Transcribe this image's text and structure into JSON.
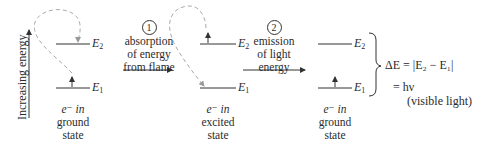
{
  "axis": {
    "label": "Increasing energy"
  },
  "levels": {
    "upper": "E",
    "upper_sub": "2",
    "lower": "E",
    "lower_sub": "1"
  },
  "states": [
    {
      "line1": "e⁻ in",
      "line2": "ground",
      "line3": "state"
    },
    {
      "line1": "e⁻ in",
      "line2": "excited",
      "line3": "state"
    },
    {
      "line1": "e⁻ in",
      "line2": "ground",
      "line3": "state"
    }
  ],
  "steps": [
    {
      "number": "1",
      "line1": "absorption",
      "line2": "of energy",
      "line3": "from flame"
    },
    {
      "number": "2",
      "line1": "emission",
      "line2": "of light",
      "line3": "energy"
    }
  ],
  "equation": {
    "lhs": "ΔE = |E₂ − E₁|",
    "rhs": "= hν",
    "note": "(visible light)"
  }
}
